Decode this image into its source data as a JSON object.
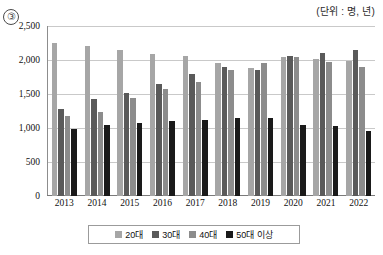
{
  "figure": {
    "number_badge": "③",
    "unit_note": "(단위 : 명, 년)"
  },
  "legend": {
    "items": [
      {
        "label": "20대",
        "color": "#a6a6a6"
      },
      {
        "label": "30대",
        "color": "#5a5a5a"
      },
      {
        "label": "40대",
        "color": "#8c8c8c"
      },
      {
        "label": "50대 이상",
        "color": "#1a1a1a"
      }
    ]
  },
  "chart_data": {
    "type": "bar",
    "title": "",
    "subtitle": "",
    "xlabel": "",
    "ylabel": "",
    "unit": "(단위 : 명, 년)",
    "grid": true,
    "legend_position": "bottom",
    "ylim": [
      0,
      2500
    ],
    "yticks": [
      "0",
      "500",
      "1,000",
      "1,500",
      "2,000",
      "2,500"
    ],
    "ytick_values": [
      0,
      500,
      1000,
      1500,
      2000,
      2500
    ],
    "categories": [
      "2013",
      "2014",
      "2015",
      "2016",
      "2017",
      "2018",
      "2019",
      "2020",
      "2021",
      "2022"
    ],
    "series": [
      {
        "name": "20대",
        "color": "#a6a6a6",
        "values": [
          2250,
          2210,
          2140,
          2090,
          2060,
          1960,
          1880,
          2050,
          2010,
          1990
        ]
      },
      {
        "name": "30대",
        "color": "#5a5a5a",
        "values": [
          1280,
          1420,
          1520,
          1640,
          1790,
          1900,
          1860,
          2060,
          2100,
          2150
        ]
      },
      {
        "name": "40대",
        "color": "#8c8c8c",
        "values": [
          1180,
          1240,
          1440,
          1580,
          1680,
          1850,
          1950,
          2040,
          1970,
          1890
        ]
      },
      {
        "name": "50대 이상",
        "color": "#1a1a1a",
        "values": [
          990,
          1040,
          1080,
          1100,
          1120,
          1140,
          1140,
          1040,
          1030,
          960
        ]
      }
    ]
  }
}
